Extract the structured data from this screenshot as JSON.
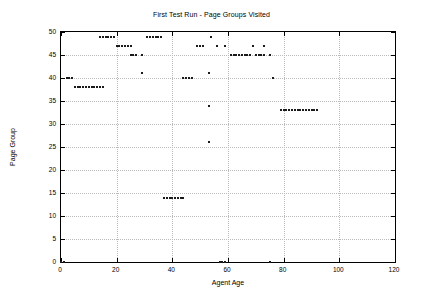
{
  "chart_data": {
    "type": "scatter",
    "title": "First Test Run - Page Groups Visited",
    "xlabel": "Agent Age",
    "ylabel": "Page Group",
    "xlim": [
      0,
      120
    ],
    "ylim": [
      0,
      50
    ],
    "xticks": [
      0,
      20,
      40,
      60,
      80,
      100,
      120
    ],
    "yticks": [
      0,
      5,
      10,
      15,
      20,
      25,
      30,
      35,
      40,
      45,
      50
    ],
    "grid": true,
    "legend": false,
    "marker": "square",
    "marker_color": "#1a1a1a",
    "points": [
      {
        "x": 0,
        "y": 0
      },
      {
        "x": 1,
        "y": 0
      },
      {
        "x": 2,
        "y": 40
      },
      {
        "x": 3,
        "y": 40
      },
      {
        "x": 4,
        "y": 40
      },
      {
        "x": 5,
        "y": 38
      },
      {
        "x": 6,
        "y": 38
      },
      {
        "x": 7,
        "y": 38
      },
      {
        "x": 8,
        "y": 38
      },
      {
        "x": 9,
        "y": 38
      },
      {
        "x": 10,
        "y": 38
      },
      {
        "x": 11,
        "y": 38
      },
      {
        "x": 12,
        "y": 38
      },
      {
        "x": 13,
        "y": 38
      },
      {
        "x": 14,
        "y": 38
      },
      {
        "x": 15,
        "y": 38
      },
      {
        "x": 14,
        "y": 49
      },
      {
        "x": 15,
        "y": 49
      },
      {
        "x": 16,
        "y": 49
      },
      {
        "x": 17,
        "y": 49
      },
      {
        "x": 18,
        "y": 49
      },
      {
        "x": 19,
        "y": 49
      },
      {
        "x": 20,
        "y": 47
      },
      {
        "x": 21,
        "y": 47
      },
      {
        "x": 22,
        "y": 47
      },
      {
        "x": 23,
        "y": 47
      },
      {
        "x": 24,
        "y": 47
      },
      {
        "x": 25,
        "y": 47
      },
      {
        "x": 25,
        "y": 45
      },
      {
        "x": 26,
        "y": 45
      },
      {
        "x": 27,
        "y": 45
      },
      {
        "x": 29,
        "y": 45
      },
      {
        "x": 29,
        "y": 41
      },
      {
        "x": 31,
        "y": 49
      },
      {
        "x": 32,
        "y": 49
      },
      {
        "x": 33,
        "y": 49
      },
      {
        "x": 34,
        "y": 49
      },
      {
        "x": 35,
        "y": 49
      },
      {
        "x": 36,
        "y": 49
      },
      {
        "x": 37,
        "y": 14
      },
      {
        "x": 38,
        "y": 14
      },
      {
        "x": 39,
        "y": 14
      },
      {
        "x": 40,
        "y": 14
      },
      {
        "x": 41,
        "y": 14
      },
      {
        "x": 42,
        "y": 14
      },
      {
        "x": 43,
        "y": 14
      },
      {
        "x": 44,
        "y": 14
      },
      {
        "x": 44,
        "y": 40
      },
      {
        "x": 45,
        "y": 40
      },
      {
        "x": 46,
        "y": 40
      },
      {
        "x": 47,
        "y": 40
      },
      {
        "x": 49,
        "y": 47
      },
      {
        "x": 50,
        "y": 47
      },
      {
        "x": 51,
        "y": 47
      },
      {
        "x": 53,
        "y": 34
      },
      {
        "x": 53,
        "y": 26
      },
      {
        "x": 53,
        "y": 41
      },
      {
        "x": 54,
        "y": 49
      },
      {
        "x": 56,
        "y": 47
      },
      {
        "x": 57,
        "y": 0
      },
      {
        "x": 58,
        "y": 0
      },
      {
        "x": 59,
        "y": 0
      },
      {
        "x": 59,
        "y": 47
      },
      {
        "x": 61,
        "y": 45
      },
      {
        "x": 62,
        "y": 45
      },
      {
        "x": 63,
        "y": 45
      },
      {
        "x": 64,
        "y": 45
      },
      {
        "x": 65,
        "y": 45
      },
      {
        "x": 66,
        "y": 45
      },
      {
        "x": 67,
        "y": 45
      },
      {
        "x": 68,
        "y": 45
      },
      {
        "x": 69,
        "y": 47
      },
      {
        "x": 70,
        "y": 45
      },
      {
        "x": 71,
        "y": 45
      },
      {
        "x": 72,
        "y": 45
      },
      {
        "x": 73,
        "y": 45
      },
      {
        "x": 73,
        "y": 47
      },
      {
        "x": 75,
        "y": 45
      },
      {
        "x": 75,
        "y": 0
      },
      {
        "x": 76,
        "y": 40
      },
      {
        "x": 79,
        "y": 33
      },
      {
        "x": 80,
        "y": 33
      },
      {
        "x": 81,
        "y": 33
      },
      {
        "x": 82,
        "y": 33
      },
      {
        "x": 83,
        "y": 33
      },
      {
        "x": 84,
        "y": 33
      },
      {
        "x": 85,
        "y": 33
      },
      {
        "x": 86,
        "y": 33
      },
      {
        "x": 87,
        "y": 33
      },
      {
        "x": 88,
        "y": 33
      },
      {
        "x": 89,
        "y": 33
      },
      {
        "x": 90,
        "y": 33
      },
      {
        "x": 91,
        "y": 33
      },
      {
        "x": 92,
        "y": 33
      }
    ]
  }
}
